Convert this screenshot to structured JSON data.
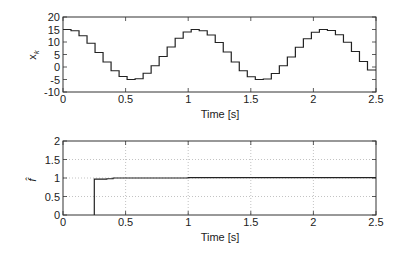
{
  "chart_data": [
    {
      "type": "line",
      "style": "step",
      "title": "",
      "xlabel": "Time [s]",
      "ylabel": "x_k",
      "xlim": [
        0,
        2.5
      ],
      "ylim": [
        -10,
        20
      ],
      "xticks": [
        0,
        0.5,
        1,
        1.5,
        2,
        2.5
      ],
      "xtick_labels": [
        "0",
        "0.5",
        "1",
        "1.5",
        "2",
        "2.5"
      ],
      "yticks": [
        -10,
        -5,
        0,
        5,
        10,
        15,
        20
      ],
      "ytick_labels": [
        "-10",
        "-5",
        "0",
        "5",
        "10",
        "15",
        "20"
      ],
      "grid": false,
      "series": [
        {
          "name": "x_k",
          "sample_period": 0.064,
          "x": [
            0,
            0.064,
            0.128,
            0.192,
            0.256,
            0.32,
            0.384,
            0.448,
            0.512,
            0.576,
            0.64,
            0.704,
            0.768,
            0.832,
            0.896,
            0.96,
            1.024,
            1.088,
            1.152,
            1.216,
            1.28,
            1.344,
            1.408,
            1.472,
            1.536,
            1.6,
            1.664,
            1.728,
            1.792,
            1.856,
            1.92,
            1.984,
            2.048,
            2.112,
            2.176,
            2.24,
            2.304,
            2.368,
            2.432
          ],
          "values": [
            15,
            14.5,
            12.5,
            9.5,
            5.8,
            2,
            -1.5,
            -3.8,
            -5,
            -4.7,
            -2.5,
            0.5,
            4.2,
            8,
            11.5,
            14,
            15,
            14.5,
            12.8,
            9.8,
            6,
            2,
            -1.5,
            -3.9,
            -5,
            -4.8,
            -2.6,
            0.5,
            4,
            7.9,
            11.3,
            13.9,
            15,
            14.6,
            12.9,
            9.9,
            6.2,
            2.2,
            -1.2
          ]
        }
      ]
    },
    {
      "type": "line",
      "style": "step",
      "title": "",
      "xlabel": "Time [s]",
      "ylabel": "f̂",
      "xlim": [
        0,
        2.5
      ],
      "ylim": [
        0,
        2
      ],
      "xticks": [
        0,
        0.5,
        1,
        1.5,
        2,
        2.5
      ],
      "xtick_labels": [
        "0",
        "0.5",
        "1",
        "1.5",
        "2",
        "2.5"
      ],
      "yticks": [
        0,
        0.5,
        1,
        1.5,
        2
      ],
      "ytick_labels": [
        "0",
        "0.5",
        "1",
        "1.5",
        "2"
      ],
      "grid": true,
      "series": [
        {
          "name": "f_hat",
          "x": [
            0.25,
            0.25,
            0.35,
            0.4,
            0.5,
            1.0,
            2.5
          ],
          "values": [
            0,
            0.97,
            0.98,
            1.0,
            1.0,
            1.01,
            1.01
          ]
        }
      ]
    }
  ],
  "plots": {
    "top": {
      "xlabel": "Time [s]",
      "ylabel_base": "x",
      "ylabel_sub": "k"
    },
    "bottom": {
      "xlabel": "Time [s]",
      "ylabel": "f̂"
    }
  },
  "colors": {
    "line": "#222222",
    "axis": "#333333",
    "grid": "#9a9a9a"
  }
}
